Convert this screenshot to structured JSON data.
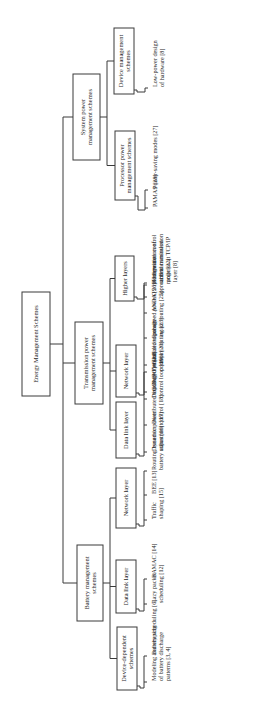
{
  "diagram": {
    "title": "Energy Management Schemes",
    "root": {
      "label": [
        "Energy Management Schemes"
      ],
      "children": [
        {
          "id": "system",
          "label": [
            "System power",
            "management schemes"
          ],
          "children": [
            {
              "id": "device-management",
              "label": [
                "Device management",
                "schemes"
              ],
              "leaves": [
                [
                  "Low-power design",
                  "of hardware [8]"
                ]
              ]
            },
            {
              "id": "processor-power",
              "label": [
                "Processor power",
                "management schemes"
              ],
              "leaves": [
                [
                  "Power-saving modes [27]"
                ],
                [
                  "PAMAS [28]"
                ]
              ]
            }
          ]
        },
        {
          "id": "transmission",
          "label": [
            "Transmission power",
            "management schemes"
          ],
          "children": [
            {
              "id": "higher-layers",
              "label": [
                "Higher layers"
              ],
              "leaves": [
                [
                  "Congestion control",
                  "and transmission",
                  "policies at TCP/IP",
                  "layer [8]"
                ],
                [
                  "OS/middleware",
                  "approaches"
                ]
              ]
            },
            {
              "id": "network-layer-tx",
              "label": [
                "Network layer"
              ],
              "leaves": [
                [
                  "COMPOW [21]"
                ],
                [
                  "Globalized power-",
                  "aware routing [23]"
                ],
                [
                  "Localized power-",
                  "aware routing [25]"
                ],
                [
                  "ANDA [26]"
                ],
                [
                  "Determination of",
                  "critical transmission",
                  "range [22]"
                ]
              ]
            },
            {
              "id": "data-link-tx",
              "label": [
                "Data link layer"
              ],
              "leaves": [
                [
                  "Dynamic power",
                  "adjustment [17]"
                ],
                [
                  "Distributed topology",
                  "control [18]"
                ],
                [
                  "Distributed power",
                  "control loop [19]"
                ],
                [
                  "Centralized topology",
                  "control [20]"
                ]
              ]
            }
          ]
        },
        {
          "id": "battery",
          "label": [
            "Battery management",
            "schemes"
          ],
          "children": [
            {
              "id": "network-layer-bat",
              "label": [
                "Network layer"
              ],
              "leaves": [
                [
                  "Traffic",
                  "shaping [15]"
                ],
                [
                  "BEE [13]"
                ],
                [
                  "Routing based on",
                  "battery status [16]"
                ]
              ]
            },
            {
              "id": "data-link-bat",
              "label": [
                "Data link layer"
              ],
              "leaves": [
                [
                  "Lazy packet",
                  "scheduling [12]"
                ],
                [
                  "BAMAC [14]"
                ]
              ]
            },
            {
              "id": "device-dependent",
              "label": [
                "Device-dependent",
                "schemes"
              ],
              "leaves": [
                [
                  "Modeling and shaping",
                  "of battery discharge",
                  "patterns [3, 4]"
                ],
                [
                  "Battery scheduling [6]"
                ]
              ]
            }
          ]
        }
      ]
    }
  }
}
